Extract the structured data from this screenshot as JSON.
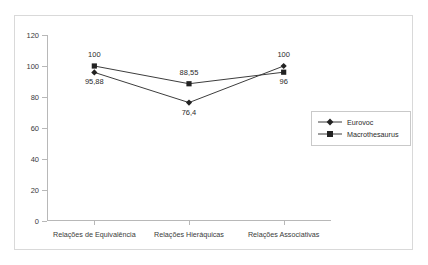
{
  "chart_data": {
    "type": "line",
    "title": "",
    "subtitle": "",
    "xlabel": "",
    "ylabel": "",
    "ylim": [
      0,
      120
    ],
    "yticks": [
      0,
      20,
      40,
      60,
      80,
      100,
      120
    ],
    "ytick_labels": [
      "0",
      "20",
      "40",
      "60",
      "80",
      "100",
      "120"
    ],
    "grid": false,
    "legend_position": "right",
    "categories": [
      "Relações de Equivalência",
      "Relações Hieráquicas",
      "Relações Associativas"
    ],
    "series": [
      {
        "name": "Eurovoc",
        "marker": "diamond",
        "color": "#222222",
        "values": [
          95.88,
          76.4,
          100
        ],
        "value_labels": [
          "95,88",
          "76,4",
          "100"
        ],
        "label_positions": [
          "below",
          "below",
          "above"
        ]
      },
      {
        "name": "Macrothesaurus",
        "marker": "square",
        "color": "#222222",
        "values": [
          100,
          88.55,
          96
        ],
        "value_labels": [
          "100",
          "88,55",
          "96"
        ],
        "label_positions": [
          "above",
          "above",
          "below"
        ]
      }
    ]
  },
  "legend": {
    "items": [
      {
        "label": "Eurovoc",
        "marker": "diamond"
      },
      {
        "label": "Macrothesaurus",
        "marker": "square"
      }
    ]
  }
}
